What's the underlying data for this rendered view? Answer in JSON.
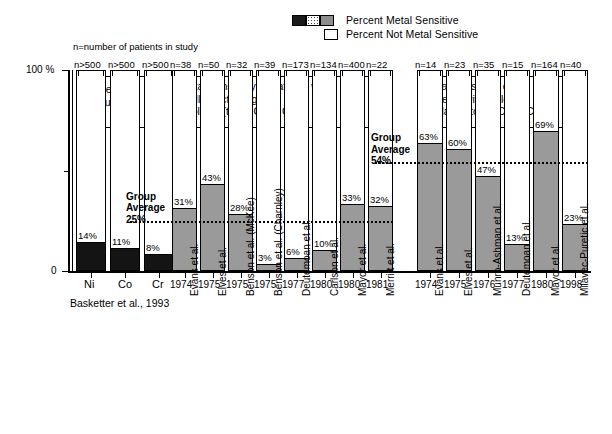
{
  "legend": {
    "sensitive_label": "Percent Metal Sensitive",
    "not_sensitive_label": "Percent Not Metal Sensitive",
    "swatches_sensitive": [
      "black",
      "dotted",
      "gray"
    ],
    "swatch_not_sensitive": "white"
  },
  "notes": {
    "n_definition": "n=number of patients in study"
  },
  "axis": {
    "y_top_label": "100 %",
    "y_zero_label": "0",
    "y_min": 0,
    "y_max": 100
  },
  "chart_data": {
    "type": "bar",
    "title": "Metal Sensitivity of Patients",
    "xlabel": "",
    "ylabel": "Percent",
    "ylim": [
      0,
      100
    ],
    "grid": false,
    "legend_position": "top-right",
    "stacked": true,
    "annotations": [
      "n=number of patients in study",
      "Group Average 25%",
      "Group Average 54%"
    ],
    "groups": [
      {
        "id": "general-population",
        "title": "General\nPopulation",
        "fill": "black",
        "source": "Basketter et al., 1993",
        "bars": [
          {
            "category": "Ni",
            "n_label": "n>500",
            "value": 14,
            "value_label": "14%"
          },
          {
            "category": "Co",
            "n_label": "n>500",
            "value": 11,
            "value_label": "11%"
          },
          {
            "category": "Cr",
            "n_label": "n>500",
            "value": 8,
            "value_label": "8%"
          }
        ]
      },
      {
        "id": "well-functioning-implants",
        "title": "Metal Sensitivity of Patients with\nWell Functioning\nImplants (to Ni, Co or Cr)",
        "fill": "gray",
        "group_average": 25,
        "group_average_label": "Group\nAverage\n25%",
        "bars": [
          {
            "author": "Evans et al.",
            "year": "1974",
            "n_label": "n=38",
            "value": 31,
            "value_label": "31%"
          },
          {
            "author": "Elves et al.",
            "year": "1975",
            "n_label": "n=50",
            "value": 43,
            "value_label": "43%"
          },
          {
            "author": "Benson et al. (McKee)",
            "year": "1975",
            "n_label": "n=32",
            "value": 28,
            "value_label": "28%"
          },
          {
            "author": "Benson et al. (Charnley)",
            "year": "1975",
            "n_label": "n=39",
            "value": 3,
            "value_label": "3%"
          },
          {
            "author": "Deutemoan et al.",
            "year": "1977",
            "n_label": "n=173",
            "value": 6,
            "value_label": "6%"
          },
          {
            "author": "Carlson et al.",
            "year": "1980",
            "n_label": "n=134",
            "value": 10,
            "value_label": "10%"
          },
          {
            "author": "Mayor et al.",
            "year": "1980",
            "n_label": "n=400",
            "value": 33,
            "value_label": "33%"
          },
          {
            "author": "Merritt et al.",
            "year": "1981",
            "n_label": "n=22",
            "value": 32,
            "value_label": "32%"
          }
        ]
      },
      {
        "id": "failed-implants",
        "title": "Metal Sensitivity of\nPatients with Failed\nImplants (to Ni, Co or Cr)",
        "fill": "gray",
        "group_average": 54,
        "group_average_label": "Group\nAverage\n54%",
        "bars": [
          {
            "author": "Evans et al.",
            "year": "1974",
            "n_label": "n=14",
            "value": 63,
            "value_label": "63%"
          },
          {
            "author": "Elves et al.",
            "year": "1975",
            "n_label": "n=23",
            "value": 60,
            "value_label": "60%"
          },
          {
            "author": "Munro-Ashman et al.",
            "year": "1976",
            "n_label": "n=35",
            "value": 47,
            "value_label": "47%"
          },
          {
            "author": "Deutemoan et al.",
            "year": "1977",
            "n_label": "n=15",
            "value": 13,
            "value_label": "13%"
          },
          {
            "author": "Mayor et al.",
            "year": "1980",
            "n_label": "n=164",
            "value": 69,
            "value_label": "69%"
          },
          {
            "author": "Milavec-Puretic et al.",
            "year": "1998",
            "n_label": "n=40",
            "value": 23,
            "value_label": "23%"
          }
        ]
      }
    ]
  }
}
